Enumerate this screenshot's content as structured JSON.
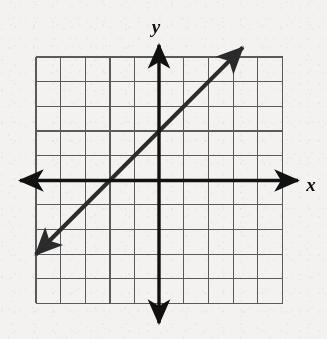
{
  "figure": {
    "name": "coordinate-plane-with-line",
    "background_color": "#f3f2f0",
    "axis_color": "#111111",
    "grid_color": "#5a5a5a",
    "line_color": "#2b2b2b"
  },
  "axes": {
    "x_label": "x",
    "y_label": "y",
    "x_axis_name": "x-axis",
    "y_axis_name": "y-axis"
  },
  "chart_data": {
    "type": "line",
    "title": "",
    "xlabel": "x",
    "ylabel": "y",
    "xlim": [
      -5,
      5
    ],
    "ylim": [
      -5,
      5
    ],
    "grid": true,
    "grid_step": 1,
    "tick_labels_shown": false,
    "legend": null,
    "series": [
      {
        "name": "line",
        "equation": "y = x + 2",
        "slope": 1,
        "y_intercept": 2,
        "x_intercept": -2,
        "double_arrow": true,
        "points": [
          {
            "x": -5,
            "y": -3
          },
          {
            "x": -2,
            "y": 0
          },
          {
            "x": 0,
            "y": 2
          },
          {
            "x": 3.4,
            "y": 5.4
          }
        ],
        "x_range": [
          -5,
          3.4
        ]
      }
    ],
    "annotations": []
  },
  "geometry": {
    "grid_left": 36,
    "grid_top": 57,
    "grid_right": 283,
    "grid_bottom": 303,
    "cell": 24.65,
    "origin_x": 159,
    "origin_y": 180.5,
    "cols": 10,
    "rows": 10
  }
}
